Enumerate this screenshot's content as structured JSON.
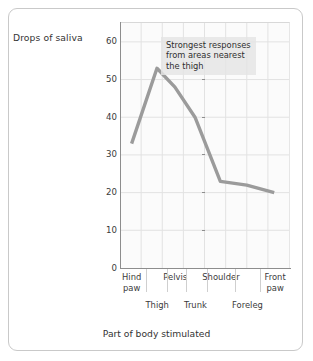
{
  "figure": {
    "frame_border_color": "#c9c9c9",
    "plot_background": "#fbfbfb",
    "grid_color": "#e2e2e2",
    "axis_color": "#8d8d8d",
    "line_color": "#9b9b9b",
    "annotation_background": "#e4e4e4"
  },
  "annotation": {
    "text": "Strongest responses\nfrom areas nearest\nthe thigh"
  },
  "chart_data": {
    "type": "line",
    "title": "",
    "xlabel": "Part of body stimulated",
    "ylabel": "Drops of saliva",
    "categories": [
      "Hind paw",
      "Thigh",
      "Pelvis",
      "Trunk",
      "Shoulder",
      "Foreleg",
      "Front paw"
    ],
    "categories_upper": [
      "Hind paw",
      "Pelvis",
      "Shoulder",
      "Front paw"
    ],
    "categories_lower": [
      "Thigh",
      "Trunk",
      "Foreleg"
    ],
    "values": [
      33,
      53,
      48,
      40,
      23,
      22,
      20
    ],
    "ylim": [
      0,
      65
    ],
    "yticks": [
      0,
      10,
      20,
      30,
      40,
      50,
      60
    ],
    "ytick_labels": [
      "0",
      "10",
      "20",
      "30",
      "40",
      "50",
      "60"
    ],
    "xlim": [
      0,
      8
    ],
    "grid": true,
    "legend": false,
    "series": [
      {
        "name": "Drops of saliva",
        "values": [
          33,
          53,
          48,
          40,
          23,
          22,
          20
        ],
        "color": "#9b9b9b"
      }
    ],
    "annotations": [
      {
        "text": "Strongest responses from areas nearest the thigh",
        "x": 2.2,
        "y": 62
      }
    ]
  },
  "x_label_text": {
    "hind_paw": "Hind\npaw",
    "pelvis": "Pelvis",
    "shoulder": "Shoulder",
    "front_paw": "Front\npaw",
    "thigh": "Thigh",
    "trunk": "Trunk",
    "foreleg": "Foreleg"
  }
}
